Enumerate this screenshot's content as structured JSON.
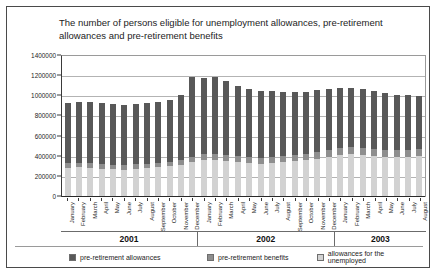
{
  "chart_title": "The number of persons eligible for unemployment allowances, pre-retirement allowances and pre-retirement benefits",
  "legend": {
    "items": [
      {
        "label": "pre-retirement allowances",
        "color": "#585858"
      },
      {
        "label": "pre-retirement benefits",
        "color": "#8e8e8e"
      },
      {
        "label": "allowances for the unemployed",
        "color": "#d2d2d2"
      }
    ]
  },
  "year_groups": [
    {
      "label": "2001",
      "count": 12
    },
    {
      "label": "2002",
      "count": 12
    },
    {
      "label": "2003",
      "count": 8
    }
  ],
  "chart_data": {
    "type": "bar",
    "stacked": true,
    "title": "The number of persons eligible for unemployment allowances, pre-retirement allowances and pre-retirement benefits",
    "xlabel": "",
    "ylabel": "",
    "ylim": [
      0,
      1400000
    ],
    "ytick_values": [
      0,
      200000,
      400000,
      600000,
      800000,
      1000000,
      1200000,
      1400000
    ],
    "ytick_labels": [
      "0",
      "200000",
      "400000",
      "600000",
      "800000",
      "1000000",
      "1200000",
      "1400000"
    ],
    "grid": true,
    "legend_position": "bottom",
    "categories": [
      "January",
      "February",
      "March",
      "April",
      "May",
      "June",
      "July",
      "August",
      "September",
      "October",
      "November",
      "December",
      "January",
      "February",
      "March",
      "April",
      "May",
      "June",
      "July",
      "August",
      "September",
      "October",
      "November",
      "December",
      "January",
      "February",
      "March",
      "April",
      "May",
      "June",
      "July",
      "August"
    ],
    "series": [
      {
        "name": "allowances for the unemployed",
        "color": "#d2d2d2",
        "values": [
          290000,
          295000,
          290000,
          280000,
          275000,
          270000,
          280000,
          285000,
          295000,
          305000,
          320000,
          345000,
          365000,
          370000,
          360000,
          345000,
          335000,
          330000,
          340000,
          345000,
          355000,
          365000,
          380000,
          400000,
          420000,
          425000,
          420000,
          410000,
          400000,
          395000,
          400000,
          405000
        ]
      },
      {
        "name": "pre-retirement benefits",
        "color": "#8e8e8e",
        "values": [
          45000,
          45000,
          45000,
          45000,
          45000,
          45000,
          45000,
          45000,
          45000,
          45000,
          50000,
          55000,
          60000,
          62000,
          62000,
          62000,
          62000,
          62000,
          62000,
          62000,
          62000,
          62000,
          64000,
          66000,
          68000,
          70000,
          70000,
          70000,
          70000,
          70000,
          70000,
          70000
        ]
      },
      {
        "name": "pre-retirement allowances",
        "color": "#585858",
        "values": [
          595000,
          600000,
          605000,
          605000,
          605000,
          600000,
          600000,
          600000,
          605000,
          615000,
          640000,
          790000,
          760000,
          755000,
          730000,
          700000,
          680000,
          665000,
          650000,
          640000,
          630000,
          620000,
          615000,
          610000,
          595000,
          590000,
          580000,
          570000,
          560000,
          550000,
          540000,
          530000
        ]
      }
    ],
    "totals": [
      930000,
      940000,
      940000,
      930000,
      925000,
      915000,
      925000,
      930000,
      945000,
      965000,
      1010000,
      1190000,
      1185000,
      1187000,
      1152000,
      1107000,
      1077000,
      1057000,
      1052000,
      1047000,
      1047000,
      1047000,
      1059000,
      1076000,
      1083000,
      1085000,
      1070000,
      1050000,
      1030000,
      1015000,
      1010000,
      1005000
    ]
  }
}
